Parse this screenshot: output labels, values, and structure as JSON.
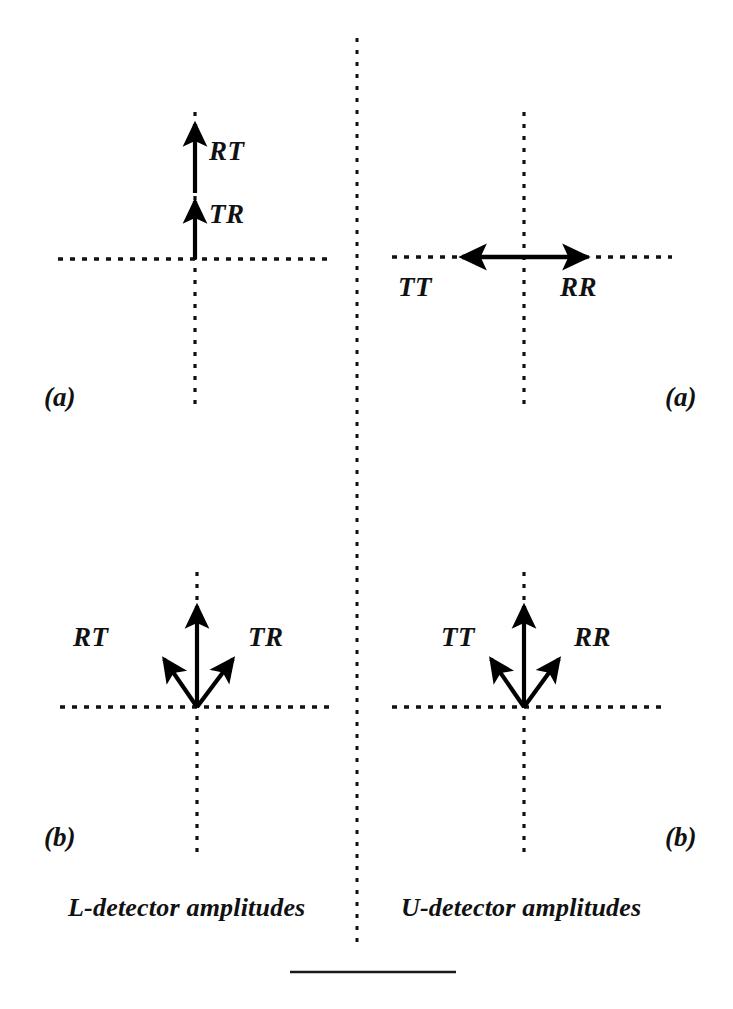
{
  "figure": {
    "header_fragment": "",
    "divider_color": "#111111",
    "stroke_color": "#000000",
    "background": "#ffffff",
    "bottom_rule": {
      "x1": 290,
      "x2": 456,
      "y": 972
    },
    "center_divider": {
      "x": 357,
      "y1": 38,
      "y2": 950
    }
  },
  "columns": [
    {
      "id": "l-detector",
      "caption": "L-detector amplitudes",
      "caption_x": 68,
      "caption_y": 910
    },
    {
      "id": "u-detector",
      "caption": "U-detector amplitudes",
      "caption_x": 401,
      "caption_y": 910
    }
  ],
  "panels": [
    {
      "id": "upper-left",
      "label": "(a)",
      "label_x": 44,
      "label_y": 388,
      "column": "l-detector",
      "origin": {
        "x": 195,
        "y": 259
      },
      "axes": {
        "horizontal": {
          "x1": 58,
          "x2": 331,
          "y": 259
        },
        "vertical": {
          "x": 195,
          "y1": 112,
          "y2": 405
        }
      },
      "vectors": [
        {
          "name": "TR",
          "label": "TR",
          "from": {
            "x": 195,
            "y": 259
          },
          "to": {
            "x": 195,
            "y": 198
          },
          "label_x": 209,
          "label_y": 205,
          "double_headed": false
        },
        {
          "name": "RT",
          "label": "RT",
          "from": {
            "x": 195,
            "y": 193
          },
          "to": {
            "x": 195,
            "y": 120
          },
          "label_x": 209,
          "label_y": 142,
          "double_headed": false
        }
      ]
    },
    {
      "id": "upper-right",
      "label": "(a)",
      "label_x": 665,
      "label_y": 388,
      "column": "u-detector",
      "origin": {
        "x": 524,
        "y": 257
      },
      "axes": {
        "horizontal": {
          "x1": 392,
          "x2": 672,
          "y": 257
        },
        "vertical": {
          "x": 524,
          "y1": 112,
          "y2": 405
        }
      },
      "vectors": [
        {
          "name": "TT-RR",
          "label": "",
          "from": {
            "x": 459,
            "y": 257
          },
          "to": {
            "x": 590,
            "y": 257
          },
          "label_x": 0,
          "label_y": 0,
          "double_headed": true
        }
      ],
      "extra_labels": [
        {
          "name": "TT",
          "label": "TT",
          "x": 398,
          "y": 276
        },
        {
          "name": "RR",
          "label": "RR",
          "x": 560,
          "y": 276
        }
      ]
    },
    {
      "id": "lower-left",
      "label": "(b)",
      "label_x": 44,
      "label_y": 828,
      "column": "l-detector",
      "origin": {
        "x": 197,
        "y": 707
      },
      "axes": {
        "horizontal": {
          "x1": 60,
          "x2": 333,
          "y": 707
        },
        "vertical": {
          "x": 197,
          "y1": 572,
          "y2": 855
        }
      },
      "vectors": [
        {
          "name": "vertical-stem",
          "label": "",
          "from": {
            "x": 197,
            "y": 707
          },
          "to": {
            "x": 197,
            "y": 602
          },
          "label_x": 0,
          "label_y": 0,
          "double_headed": false
        },
        {
          "name": "RT",
          "label": "RT",
          "from": {
            "x": 197,
            "y": 707
          },
          "to": {
            "x": 160,
            "y": 655
          },
          "label_x": 73,
          "label_y": 628,
          "double_headed": false
        },
        {
          "name": "TR",
          "label": "TR",
          "from": {
            "x": 197,
            "y": 707
          },
          "to": {
            "x": 237,
            "y": 655
          },
          "label_x": 248,
          "label_y": 628,
          "double_headed": false
        }
      ]
    },
    {
      "id": "lower-right",
      "label": "(b)",
      "label_x": 665,
      "label_y": 828,
      "column": "u-detector",
      "origin": {
        "x": 524,
        "y": 707
      },
      "axes": {
        "horizontal": {
          "x1": 392,
          "x2": 668,
          "y": 707
        },
        "vertical": {
          "x": 524,
          "y1": 572,
          "y2": 855
        }
      },
      "vectors": [
        {
          "name": "vertical-stem",
          "label": "",
          "from": {
            "x": 524,
            "y": 707
          },
          "to": {
            "x": 524,
            "y": 602
          },
          "label_x": 0,
          "label_y": 0,
          "double_headed": false
        },
        {
          "name": "TT",
          "label": "TT",
          "from": {
            "x": 524,
            "y": 707
          },
          "to": {
            "x": 487,
            "y": 655
          },
          "label_x": 441,
          "label_y": 628,
          "double_headed": false
        },
        {
          "name": "RR",
          "label": "RR",
          "from": {
            "x": 524,
            "y": 707
          },
          "to": {
            "x": 563,
            "y": 655
          },
          "label_x": 574,
          "label_y": 628,
          "double_headed": false
        }
      ]
    }
  ]
}
